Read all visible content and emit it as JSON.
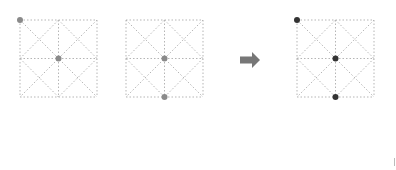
{
  "diagram": {
    "type": "grid-transformation",
    "grid_style": {
      "line_color": "#b5b5b5",
      "dash": "1.5,2",
      "subdivisions": 2,
      "diagonals": true
    },
    "panels": [
      {
        "id": "input-1",
        "x": 20,
        "y": 20,
        "size": 77,
        "dot_color": "#8a8a8a",
        "dots": [
          {
            "col": 0,
            "row": 0
          },
          {
            "col": 1,
            "row": 1
          }
        ]
      },
      {
        "id": "input-2",
        "x": 126,
        "y": 20,
        "size": 77,
        "dot_color": "#8a8a8a",
        "dots": [
          {
            "col": 1,
            "row": 1
          },
          {
            "col": 1,
            "row": 2
          }
        ]
      },
      {
        "id": "output",
        "x": 297,
        "y": 20,
        "size": 77,
        "dot_color": "#333333",
        "dots": [
          {
            "col": 0,
            "row": 0
          },
          {
            "col": 1,
            "row": 1
          },
          {
            "col": 1,
            "row": 2
          }
        ]
      }
    ],
    "arrow": {
      "direction": "right",
      "color": "#777777",
      "x": 240,
      "y": 52,
      "width": 20,
      "height": 16
    }
  }
}
